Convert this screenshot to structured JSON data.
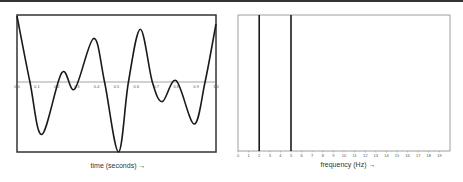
{
  "chart_data": [
    {
      "type": "line",
      "title": "",
      "xlabel": "time (seconds) →",
      "ylabel": "",
      "xlim": [
        0.0,
        1.0
      ],
      "ylim": [
        -1.0,
        1.0
      ],
      "grid": false,
      "legend": null,
      "x_ticks": [
        "0.0",
        "0.1",
        "0.2",
        "0.3",
        "0.4",
        "0.5",
        "0.6",
        "0.7",
        "0.8",
        "0.9",
        "1.0"
      ],
      "series": [
        {
          "name": "signal",
          "x": [
            0.0,
            0.065,
            0.125,
            0.225,
            0.29,
            0.385,
            0.44,
            0.51,
            0.56,
            0.62,
            0.68,
            0.73,
            0.8,
            0.89,
            0.945,
            1.0
          ],
          "values": [
            1.0,
            0.0,
            -0.75,
            0.14,
            -0.1,
            0.66,
            0.0,
            -1.0,
            0.0,
            0.8,
            0.0,
            -0.28,
            0.02,
            -0.6,
            0.0,
            0.88
          ]
        }
      ]
    },
    {
      "type": "bar",
      "title": "",
      "xlabel": "frequency (Hz) →",
      "ylabel": "",
      "xlim": [
        0,
        20
      ],
      "grid": false,
      "legend": null,
      "x_ticks": [
        "0",
        "1",
        "2",
        "3",
        "4",
        "5",
        "6",
        "7",
        "8",
        "9",
        "10",
        "11",
        "12",
        "13",
        "14",
        "15",
        "16",
        "17",
        "18",
        "19"
      ],
      "categories": [
        2,
        5
      ],
      "values": [
        1,
        1
      ]
    }
  ],
  "left_chart": {
    "xlabel": "time (seconds) →"
  },
  "right_chart": {
    "xlabel": "frequency (Hz) →"
  },
  "colors": {
    "line": "#1a1a1a",
    "frame_left": "#333333",
    "frame_right": "#888888",
    "axis": "#666666"
  }
}
